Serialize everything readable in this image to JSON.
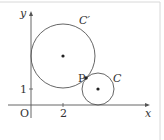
{
  "diagram": {
    "axes": {
      "x_label": "x",
      "y_label": "y",
      "origin_label": "O",
      "x_tick_label": "2",
      "y_tick_label": "1"
    },
    "circles": [
      {
        "id": "C_prime",
        "label": "C′",
        "center": [
          2,
          3
        ],
        "radius": 2
      },
      {
        "id": "C",
        "label": "C",
        "center": [
          4,
          1
        ],
        "radius": 1
      }
    ],
    "point": {
      "label": "P"
    },
    "colors": {
      "stroke": "#555555",
      "text": "#333333",
      "border": "#d8d8d8",
      "background": "#ffffff"
    }
  }
}
